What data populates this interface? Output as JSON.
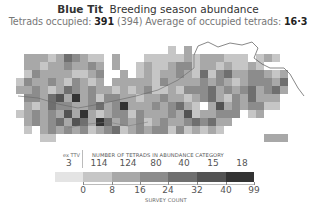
{
  "header": {
    "species": "Blue Tit",
    "map_type": "Breeding season abundance",
    "tetrads_label": "Tetrads occupied:",
    "tetrads_occupied": "391",
    "tetrads_total": "(394)",
    "average_label": "Average of occupied tetrads:",
    "average_value": "16·3"
  },
  "legend": {
    "ex_ttv_label": "ex TTV",
    "ex_ttv_count": "3",
    "category_header": "NUMBER OF TETRADS IN ABUNDANCE CATEGORY",
    "category_counts": [
      "114",
      "124",
      "80",
      "40",
      "15",
      "18"
    ],
    "axis_ticks": [
      "0",
      "8",
      "16",
      "24",
      "32",
      "40",
      "99"
    ],
    "axis_title": "SURVEY COUNT"
  },
  "chart_data": {
    "type": "heatmap",
    "subtitle": "Tetrads occupied: 391 (394) Average of occupied tetrads: 16·3",
    "legend": {
      "categories": [
        "ex TTV",
        "0-8",
        "8-16",
        "16-24",
        "24-32",
        "32-40",
        "40-99"
      ],
      "counts": [
        3,
        114,
        124,
        80,
        40,
        15,
        18
      ],
      "colors": [
        "#e4e4e4",
        "#c6c6c6",
        "#a8a8a8",
        "#8c8c8c",
        "#6f6f6f",
        "#535353",
        "#333333"
      ],
      "xlabel": "SURVEY COUNT",
      "ticks": [
        0,
        8,
        16,
        24,
        32,
        40,
        99
      ]
    },
    "grid": {
      "cell_px": 8,
      "rows": [
        "...........................................",
        "....................1.2...............",
        "..2221243211.2...1111121222111.121.....",
        "..2212232232.2..1211233122121121.......",
        "..1322221123..2.1212232141342233212....",
        ".13223213212.2222213222232321233324...",
        ".2232124323221212311213334232342342...",
        "..33245262313322122322123421324222.....",
        "..2124332234236222323421.252323311.....",
        ".1232325262123313222325122333.12.......",
        "..23234254264232312322343422..........",
        "..1.23232312341232331312121...........",
        "....11..........................222.....",
        "....................................."
      ]
    }
  },
  "colors": {
    "c0": "#e4e4e4",
    "c1": "#c6c6c6",
    "c2": "#a8a8a8",
    "c3": "#8c8c8c",
    "c4": "#6f6f6f",
    "c5": "#535353",
    "c6": "#333333",
    "river": "#555555"
  }
}
